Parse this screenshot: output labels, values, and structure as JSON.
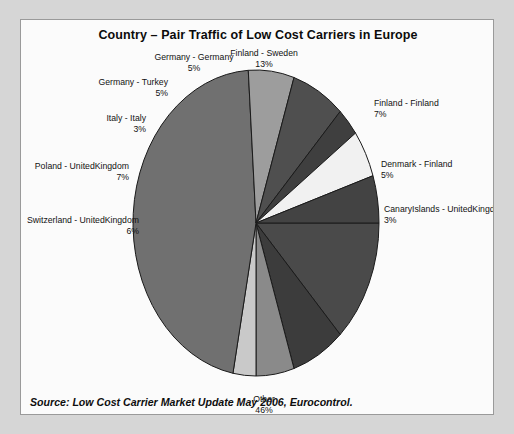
{
  "chart_data": {
    "type": "pie",
    "title": "Country – Pair Traffic of Low Cost Carriers in Europe",
    "source": "Source: Low Cost Carrier Market Update May 2006, Eurocontrol.",
    "unit": "%",
    "legend_position": "none",
    "labels_outside": true,
    "categories": [
      "Finland - Sweden",
      "Finland - Finland",
      "Denmark - Finland",
      "CanaryIslands - UnitedKingdom",
      "Other",
      "Switzerland - UnitedKingdom",
      "Poland - UnitedKingdom",
      "Italy - Italy",
      "Germany - Turkey",
      "Germany - Germany"
    ],
    "values": [
      13,
      7,
      5,
      3,
      46,
      6,
      7,
      3,
      5,
      5
    ],
    "colors": [
      "#4a4a4a",
      "#3c3c3c",
      "#8a8a8a",
      "#c9c9c9",
      "#707070",
      "#9d9d9d",
      "#4f4f4f",
      "#3f3f3f",
      "#f1f1f1",
      "#434343"
    ],
    "slices": [
      {
        "label": "Finland - Sweden",
        "value": 13,
        "pct_text": "13%",
        "color": "#4a4a4a"
      },
      {
        "label": "Finland - Finland",
        "value": 7,
        "pct_text": "7%",
        "color": "#3c3c3c"
      },
      {
        "label": "Denmark - Finland",
        "value": 5,
        "pct_text": "5%",
        "color": "#8a8a8a"
      },
      {
        "label": "CanaryIslands - UnitedKingdom",
        "value": 3,
        "pct_text": "3%",
        "color": "#c9c9c9"
      },
      {
        "label": "Other",
        "value": 46,
        "pct_text": "46%",
        "color": "#707070"
      },
      {
        "label": "Switzerland - UnitedKingdom",
        "value": 6,
        "pct_text": "6%",
        "color": "#9d9d9d"
      },
      {
        "label": "Poland - UnitedKingdom",
        "value": 7,
        "pct_text": "7%",
        "color": "#4f4f4f"
      },
      {
        "label": "Italy - Italy",
        "value": 3,
        "pct_text": "3%",
        "color": "#3f3f3f"
      },
      {
        "label": "Germany - Turkey",
        "value": 5,
        "pct_text": "5%",
        "color": "#f1f1f1"
      },
      {
        "label": "Germany - Germany",
        "value": 5,
        "pct_text": "5%",
        "color": "#434343"
      }
    ],
    "geometry": {
      "cx": 235,
      "cy": 203,
      "rx": 123,
      "ry": 153,
      "start_angle_deg": 0,
      "direction": "clockwise",
      "stroke": "#1a1a1a",
      "stroke_width": 1
    },
    "label_positions": [
      {
        "label": "Finland - Sweden",
        "x": 243,
        "y": 28,
        "align": "center"
      },
      {
        "label": "Finland - Finland",
        "x": 353,
        "y": 78,
        "align": "right"
      },
      {
        "label": "Denmark - Finland",
        "x": 360,
        "y": 139,
        "align": "right"
      },
      {
        "label": "CanaryIslands - UnitedKingdom",
        "x": 363,
        "y": 184,
        "align": "right"
      },
      {
        "label": "Other",
        "x": 243,
        "y": 374,
        "align": "center"
      },
      {
        "label": "Switzerland - UnitedKingdom",
        "x": 118,
        "y": 195,
        "align": "left"
      },
      {
        "label": "Poland - UnitedKingdom",
        "x": 108,
        "y": 141,
        "align": "left"
      },
      {
        "label": "Italy - Italy",
        "x": 125,
        "y": 93,
        "align": "left"
      },
      {
        "label": "Germany - Turkey",
        "x": 147,
        "y": 57,
        "align": "left"
      },
      {
        "label": "Germany - Germany",
        "x": 173,
        "y": 32,
        "align": "center"
      }
    ]
  },
  "panel": {
    "background": "#fbfbfb",
    "border_color": "#9a9a9a"
  },
  "page": {
    "background": "#d6d6d6"
  }
}
